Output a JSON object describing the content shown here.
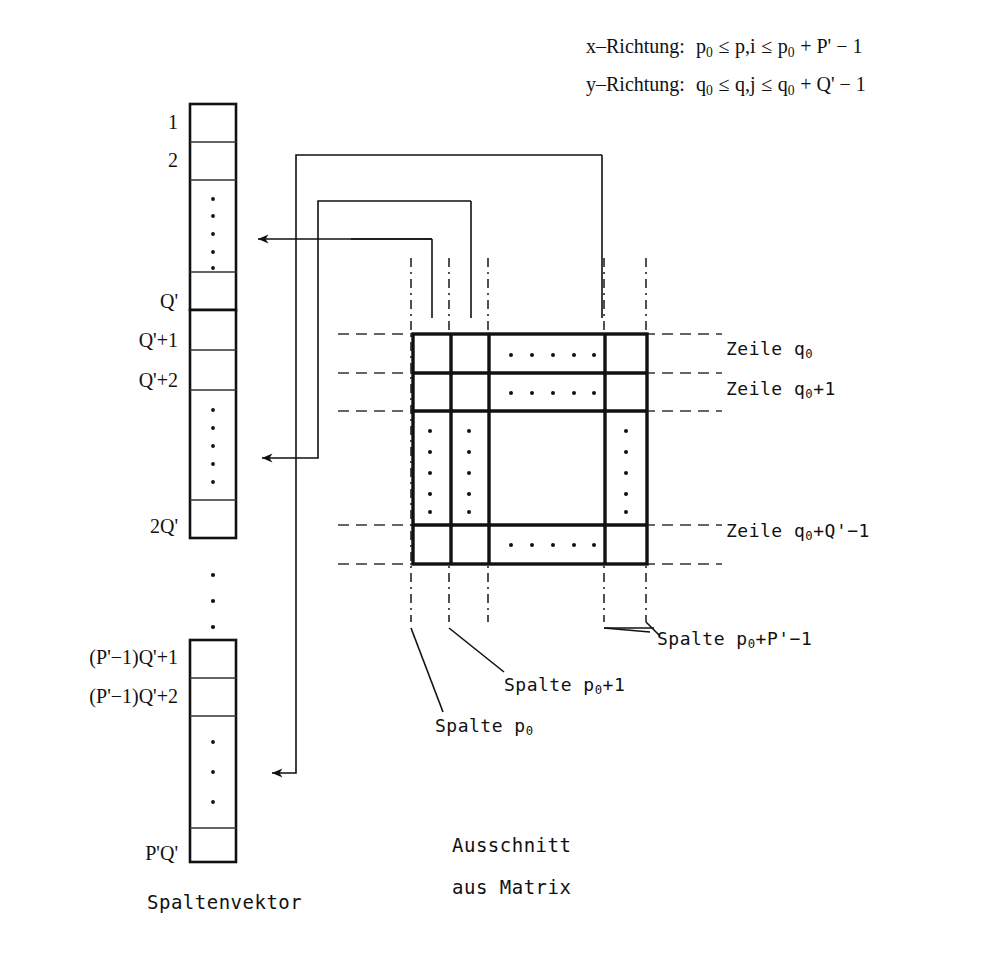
{
  "figure": {
    "title_formulas": [
      "x–Richtung:  p0 ≤ p,i ≤ p0 + P' − 1",
      "y–Richtung:  q0 ≤ q,j ≤ q0 + Q' − 1"
    ],
    "formula_x": {
      "axis": "x–Richtung:",
      "lower": "p",
      "lower_sub": "0",
      "rel1": "≤",
      "vars": "p,i",
      "rel2": "≤",
      "upper_base": "p",
      "upper_sub": "0",
      "upper_rest": "+ P' − 1"
    },
    "formula_y": {
      "axis": "y–Richtung:",
      "lower": "q",
      "lower_sub": "0",
      "rel1": "≤",
      "vars": "q,j",
      "rel2": "≤",
      "upper_base": "q",
      "upper_sub": "0",
      "upper_rest": "+ Q' − 1"
    },
    "vector": {
      "caption": "Spaltenvektor",
      "labels": {
        "one": "1",
        "two": "2",
        "q": "Q'",
        "q_plus_1": "Q'+1",
        "q_plus_2": "Q'+2",
        "two_q": "2Q'",
        "pm1q_plus_1": "(P'−1)Q'+1",
        "pm1q_plus_2": "(P'−1)Q'+2",
        "pq": "P'Q'"
      }
    },
    "matrix": {
      "caption_line1": "Ausschnitt",
      "caption_line2": "aus Matrix",
      "row_labels": [
        {
          "prefix": "Zeile  q",
          "sub": "0",
          "rest": ""
        },
        {
          "prefix": "Zeile  q",
          "sub": "0",
          "rest": "+1"
        },
        {
          "prefix": "Zeile  q",
          "sub": "0",
          "rest": "+Q'−1"
        }
      ],
      "column_labels": [
        {
          "prefix": "Spalte  p",
          "sub": "0",
          "rest": ""
        },
        {
          "prefix": "Spalte  p",
          "sub": "0",
          "rest": "+1"
        },
        {
          "prefix": "Spalte  p",
          "sub": "0",
          "rest": "+P'−1"
        }
      ]
    },
    "colors": {
      "ink": "#111111",
      "background": "#ffffff",
      "rule": "#1a1a1a"
    }
  }
}
